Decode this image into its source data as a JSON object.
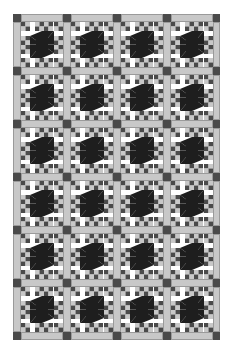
{
  "quilt": {
    "title": "Star block quilt with sashing",
    "columns": 4,
    "rows": 6,
    "block_count": 24,
    "colors": {
      "dark": "#1e1e1e",
      "medium_dark": "#4a4a4a",
      "light_gray": "#c8c8c8",
      "white": "#ffffff"
    }
  }
}
